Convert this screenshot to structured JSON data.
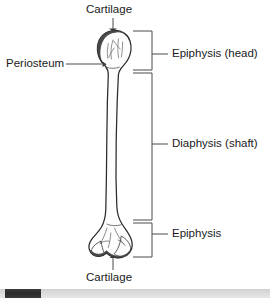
{
  "figure": {
    "type": "anatomical-diagram",
    "labels": {
      "cartilage_top": "Cartilage",
      "periosteum": "Periosteum",
      "epiphysis_head": "Epiphysis (head)",
      "diaphysis": "Diaphysis (shaft)",
      "epiphysis_distal": "Epiphysis",
      "cartilage_bottom": "Cartilage"
    },
    "colors": {
      "outline": "#2b2b2b",
      "text": "#1a1a1a",
      "cartilage_fill": "#4a4a4a",
      "bone_fill": "#fdfdfd",
      "leader_line": "#4a4a4a",
      "scrollbar_thumb": "#2b2b2b",
      "scrollbar_track": "#dcdcdc"
    }
  },
  "scrollbar": {
    "orientation": "horizontal",
    "thumb_position_percent": 2,
    "thumb_width_percent": 13
  }
}
